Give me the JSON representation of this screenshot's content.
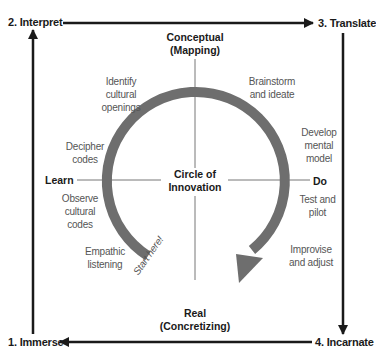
{
  "stages": {
    "immerse": "1. Immerse",
    "interpret": "2. Interpret",
    "translate": "3. Translate",
    "incarnate": "4. Incarnate"
  },
  "axes": {
    "top_line1": "Conceptual",
    "top_line2": "(Mapping)",
    "bottom_line1": "Real",
    "bottom_line2": "(Concretizing)",
    "left": "Learn",
    "right": "Do"
  },
  "center": {
    "line1": "Circle of",
    "line2": "Innovation"
  },
  "steps": {
    "identify": [
      "Identify",
      "cultural",
      "openings"
    ],
    "decipher": [
      "Decipher",
      "codes"
    ],
    "observe": [
      "Observe",
      "cultural",
      "codes"
    ],
    "empathic": [
      "Empathic",
      "listening"
    ],
    "brainstorm": [
      "Brainstorm",
      "and ideate"
    ],
    "develop": [
      "Develop",
      "mental",
      "model"
    ],
    "test": [
      "Test and",
      "pilot"
    ],
    "improvise": [
      "Improvise",
      "and adjust"
    ]
  },
  "start_label": "Start here!",
  "colors": {
    "frame": "#1a1a1a",
    "arc": "#6e6e6e",
    "cross": "#777777",
    "step_text": "#555555"
  }
}
